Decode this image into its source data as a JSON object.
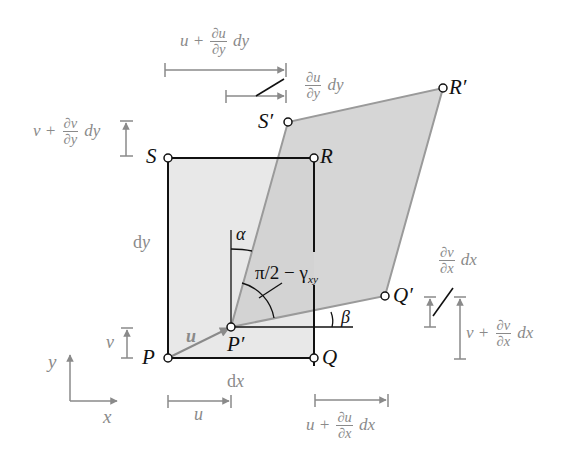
{
  "points": {
    "P": {
      "label": "P",
      "x": 168,
      "y": 358
    },
    "Q": {
      "label": "Q",
      "x": 314,
      "y": 358
    },
    "R": {
      "label": "R",
      "x": 314,
      "y": 158
    },
    "S": {
      "label": "S",
      "x": 168,
      "y": 158
    },
    "P_prime": {
      "label": "P′",
      "x": 231,
      "y": 327
    },
    "Q_prime": {
      "label": "Q′",
      "x": 385,
      "y": 296
    },
    "R_prime": {
      "label": "R′",
      "x": 443,
      "y": 88
    },
    "S_prime": {
      "label": "S′",
      "x": 288,
      "y": 122
    }
  },
  "colors": {
    "original_fill": "#e6e6e6",
    "deformed_fill": "#d4d4d4",
    "deformed_stroke": "#9a9a9a",
    "outline": "#111111",
    "annotation": "#8a8a8a"
  },
  "labels": {
    "dx": "dx",
    "dy": "dy",
    "u_vec": "u",
    "u": "u",
    "v": "v",
    "alpha": "α",
    "beta": "β",
    "angle": "π/2 − γ",
    "angle_sub": "xy",
    "axis_x": "x",
    "axis_y": "y"
  },
  "annotations": {
    "top_long": {
      "prefix": "u +",
      "num": "∂u",
      "den": "∂y",
      "suffix": "dy"
    },
    "top_short": {
      "num": "∂u",
      "den": "∂y",
      "suffix": "dy"
    },
    "left_top": {
      "prefix": "v +",
      "num": "∂v",
      "den": "∂y",
      "suffix": "dy"
    },
    "right_short": {
      "num": "∂v",
      "den": "∂x",
      "suffix": "dx"
    },
    "right_long": {
      "prefix": "v +",
      "num": "∂v",
      "den": "∂x",
      "suffix": "dx"
    },
    "bottom_right": {
      "prefix": "u +",
      "num": "∂u",
      "den": "∂x",
      "suffix": "dx"
    }
  }
}
